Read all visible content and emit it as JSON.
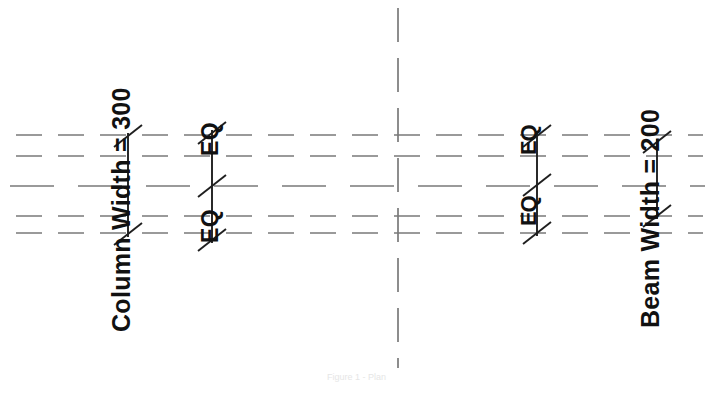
{
  "drawing": {
    "title": "Structural Framing Dimension Plan",
    "background_color": "#ffffff",
    "line_color": "#6d6d6d",
    "dim_color": "#1a1a1a",
    "width": 719,
    "height": 393,
    "labels": {
      "column_width": "Column Width = 300",
      "eq_left_upper": "EQ",
      "eq_left_lower": "EQ",
      "eq_right_upper": "EQ",
      "eq_right_lower": "EQ",
      "beam_width": "Beam Width = 200"
    },
    "values": {
      "column_width_value": "300",
      "beam_width_value": "200"
    },
    "gridlines": {
      "orientation": "horizontal",
      "style": "dashed",
      "count": 5,
      "y_positions": [
        135,
        156,
        186,
        216,
        233
      ]
    },
    "centerline": {
      "orientation": "vertical",
      "style": "dash-dot",
      "x_position": 398
    },
    "dimension_lines": [
      {
        "name": "column-width-dimension",
        "x": 128,
        "y_top": 133,
        "y_bottom": 237,
        "tick_style": "architectural-slash",
        "segments": 1,
        "label": "Column Width = 300"
      },
      {
        "name": "eq-left-dimension",
        "x": 212,
        "y_top": 130,
        "y_bottom": 243,
        "tick_style": "architectural-slash",
        "segments": 2,
        "label": "EQ EQ"
      },
      {
        "name": "eq-right-dimension",
        "x": 537,
        "y_top": 133,
        "y_bottom": 236,
        "tick_style": "architectural-slash",
        "segments": 2,
        "label": "EQ EQ"
      },
      {
        "name": "beam-width-dimension",
        "x": 657,
        "y_top": 139,
        "y_bottom": 219,
        "tick_style": "architectural-slash",
        "segments": 1,
        "label": "Beam Width = 200"
      }
    ],
    "footer": {
      "caption": "Figure 1 - Plan"
    }
  }
}
